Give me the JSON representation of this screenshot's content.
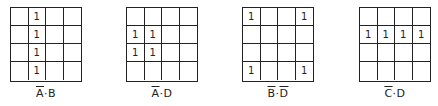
{
  "maps": [
    {
      "id": "a-bar-b",
      "label_parts": [
        {
          "text": "A",
          "bar": true
        },
        {
          "text": "·",
          "bar": false
        },
        {
          "text": "B",
          "bar": false
        }
      ],
      "cells": [
        [
          "",
          "1",
          "",
          ""
        ],
        [
          "",
          "1",
          "",
          ""
        ],
        [
          "",
          "1",
          "",
          ""
        ],
        [
          "",
          "1",
          "",
          ""
        ]
      ]
    },
    {
      "id": "a-bar-d",
      "label_parts": [
        {
          "text": "A",
          "bar": true
        },
        {
          "text": "·",
          "bar": false
        },
        {
          "text": "D",
          "bar": false
        }
      ],
      "cells": [
        [
          "",
          "",
          "",
          ""
        ],
        [
          "1",
          "1",
          "",
          ""
        ],
        [
          "1",
          "1",
          "",
          ""
        ],
        [
          "",
          "",
          "",
          ""
        ]
      ]
    },
    {
      "id": "b-bar-d-bar",
      "label_parts": [
        {
          "text": "B",
          "bar": true
        },
        {
          "text": "·",
          "bar": false
        },
        {
          "text": "D",
          "bar": true
        }
      ],
      "cells": [
        [
          "1",
          "",
          "",
          "1"
        ],
        [
          "",
          "",
          "",
          ""
        ],
        [
          "",
          "",
          "",
          ""
        ],
        [
          "1",
          "",
          "",
          "1"
        ]
      ]
    },
    {
      "id": "c-bar-d",
      "label_parts": [
        {
          "text": "C",
          "bar": true
        },
        {
          "text": "·",
          "bar": false
        },
        {
          "text": "D",
          "bar": false
        }
      ],
      "cells": [
        [
          "",
          "",
          "",
          ""
        ],
        [
          "1",
          "1",
          "1",
          "1"
        ],
        [
          "",
          "",
          "",
          ""
        ],
        [
          "",
          "",
          "",
          ""
        ]
      ]
    }
  ]
}
